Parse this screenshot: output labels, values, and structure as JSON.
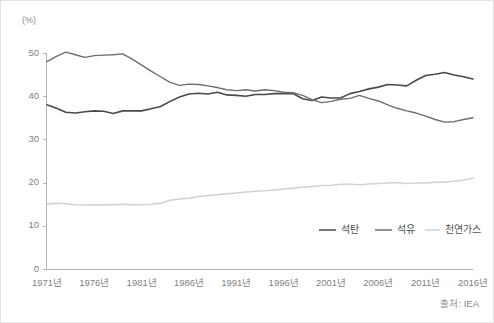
{
  "figure": {
    "unit_label": "(%)",
    "source_note": "출처: IEA",
    "background_color": "#ffffff",
    "border_color": "#e3e3e3"
  },
  "chart_data": {
    "type": "line",
    "title": "",
    "subtitle": "",
    "xlabel": "",
    "ylabel": "(%)",
    "unit": "%",
    "grid": false,
    "legend_position": "bottom-right",
    "xlim": [
      1971,
      2016
    ],
    "ylim": [
      0,
      50
    ],
    "yticks": [
      0,
      10,
      20,
      30,
      40,
      50
    ],
    "ytick_labels": [
      "0",
      "10",
      "20",
      "30",
      "40",
      "50"
    ],
    "xticks": [
      1971,
      1976,
      1981,
      1986,
      1991,
      1996,
      2001,
      2006,
      2011,
      2016
    ],
    "xtick_labels": [
      "1971년",
      "1976년",
      "1981년",
      "1986년",
      "1991년",
      "1996년",
      "2001년",
      "2006년",
      "2011년",
      "2016년"
    ],
    "x": [
      1971,
      1972,
      1973,
      1974,
      1975,
      1976,
      1977,
      1978,
      1979,
      1980,
      1981,
      1982,
      1983,
      1984,
      1985,
      1986,
      1987,
      1988,
      1989,
      1990,
      1991,
      1992,
      1993,
      1994,
      1995,
      1996,
      1997,
      1998,
      1999,
      2000,
      2001,
      2002,
      2003,
      2004,
      2005,
      2006,
      2007,
      2008,
      2009,
      2010,
      2011,
      2012,
      2013,
      2014,
      2015,
      2016
    ],
    "series": [
      {
        "name": "석탄",
        "color": "#4a4a4a",
        "width": 1.6,
        "values": [
          38.0,
          37.2,
          36.3,
          36.1,
          36.4,
          36.6,
          36.5,
          36.0,
          36.6,
          36.6,
          36.6,
          37.1,
          37.6,
          38.8,
          39.8,
          40.5,
          40.7,
          40.5,
          40.9,
          40.3,
          40.2,
          40.0,
          40.4,
          40.4,
          40.6,
          40.6,
          40.6,
          39.4,
          39.0,
          39.8,
          39.6,
          39.6,
          40.6,
          41.1,
          41.7,
          42.1,
          42.7,
          42.6,
          42.4,
          43.7,
          44.8,
          45.1,
          45.5,
          44.9,
          44.5,
          44.0
        ]
      },
      {
        "name": "석유",
        "color": "#6e6e6e",
        "width": 1.4,
        "values": [
          48.0,
          49.2,
          50.2,
          49.6,
          49.0,
          49.4,
          49.5,
          49.6,
          49.8,
          48.6,
          47.2,
          45.8,
          44.5,
          43.2,
          42.5,
          42.8,
          42.7,
          42.4,
          42.0,
          41.5,
          41.3,
          41.5,
          41.2,
          41.5,
          41.3,
          40.9,
          40.8,
          40.2,
          39.2,
          38.5,
          38.8,
          39.3,
          39.5,
          40.2,
          39.5,
          38.9,
          38.0,
          37.2,
          36.6,
          36.1,
          35.4,
          34.6,
          34.0,
          34.1,
          34.6,
          35.0
        ]
      },
      {
        "name": "천연가스",
        "color": "#d2d2d2",
        "width": 1.5,
        "values": [
          15.0,
          15.2,
          15.1,
          14.9,
          14.8,
          14.9,
          14.8,
          14.9,
          15.0,
          14.9,
          14.9,
          15.0,
          15.2,
          15.9,
          16.2,
          16.4,
          16.8,
          17.0,
          17.2,
          17.4,
          17.6,
          17.8,
          18.0,
          18.1,
          18.3,
          18.5,
          18.7,
          18.9,
          19.1,
          19.3,
          19.4,
          19.6,
          19.6,
          19.5,
          19.7,
          19.8,
          19.9,
          20.0,
          19.8,
          19.9,
          19.9,
          20.1,
          20.1,
          20.3,
          20.6,
          21.0
        ]
      }
    ]
  },
  "legend": {
    "entries": [
      {
        "label": "석탄",
        "color": "#4a4a4a"
      },
      {
        "label": "석유",
        "color": "#6e6e6e"
      },
      {
        "label": "천연가스",
        "color": "#d2d2d2"
      }
    ]
  }
}
